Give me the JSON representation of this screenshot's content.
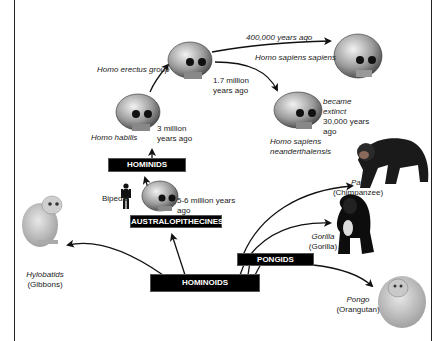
{
  "diagram": {
    "groups": {
      "hominoids": "HOMINOIDS",
      "pongids": "PONGIDS",
      "australopithecines": "AUSTRALOPITHECINES",
      "hominids": "HOMINIDS"
    },
    "species": {
      "homo_habilis": {
        "name": "Homo habilis",
        "time": [
          "3 million",
          "years ago"
        ]
      },
      "homo_erectus": {
        "name": "Homo erectus group",
        "time": [
          "1.7 million",
          "years ago"
        ]
      },
      "homo_sapiens_sapiens": {
        "name": "Homo sapiens sapiens",
        "time": "400,000 years ago"
      },
      "neanderthal": {
        "name": [
          "Homo sapiens",
          "neanderthalensis"
        ],
        "note": [
          "became",
          "extinct",
          "30,000 years",
          "ago"
        ]
      },
      "australopithecine": {
        "time": [
          "5-6 million years",
          "ago"
        ],
        "bipedal": "Bipedal"
      },
      "pan": {
        "genus": "Pan",
        "common": "(Chimpanzee)"
      },
      "gorilla": {
        "genus": "Gorilla",
        "common": "(Gorilla)"
      },
      "pongo": {
        "genus": "Pongo",
        "common": "(Orangutan)"
      },
      "hylobatids": {
        "genus": "Hylobatids",
        "common": "(Gibbons)"
      }
    },
    "colors": {
      "box_bg": "#000000",
      "box_text": "#ffffff",
      "line": "#111111",
      "frame": "#222222"
    }
  }
}
